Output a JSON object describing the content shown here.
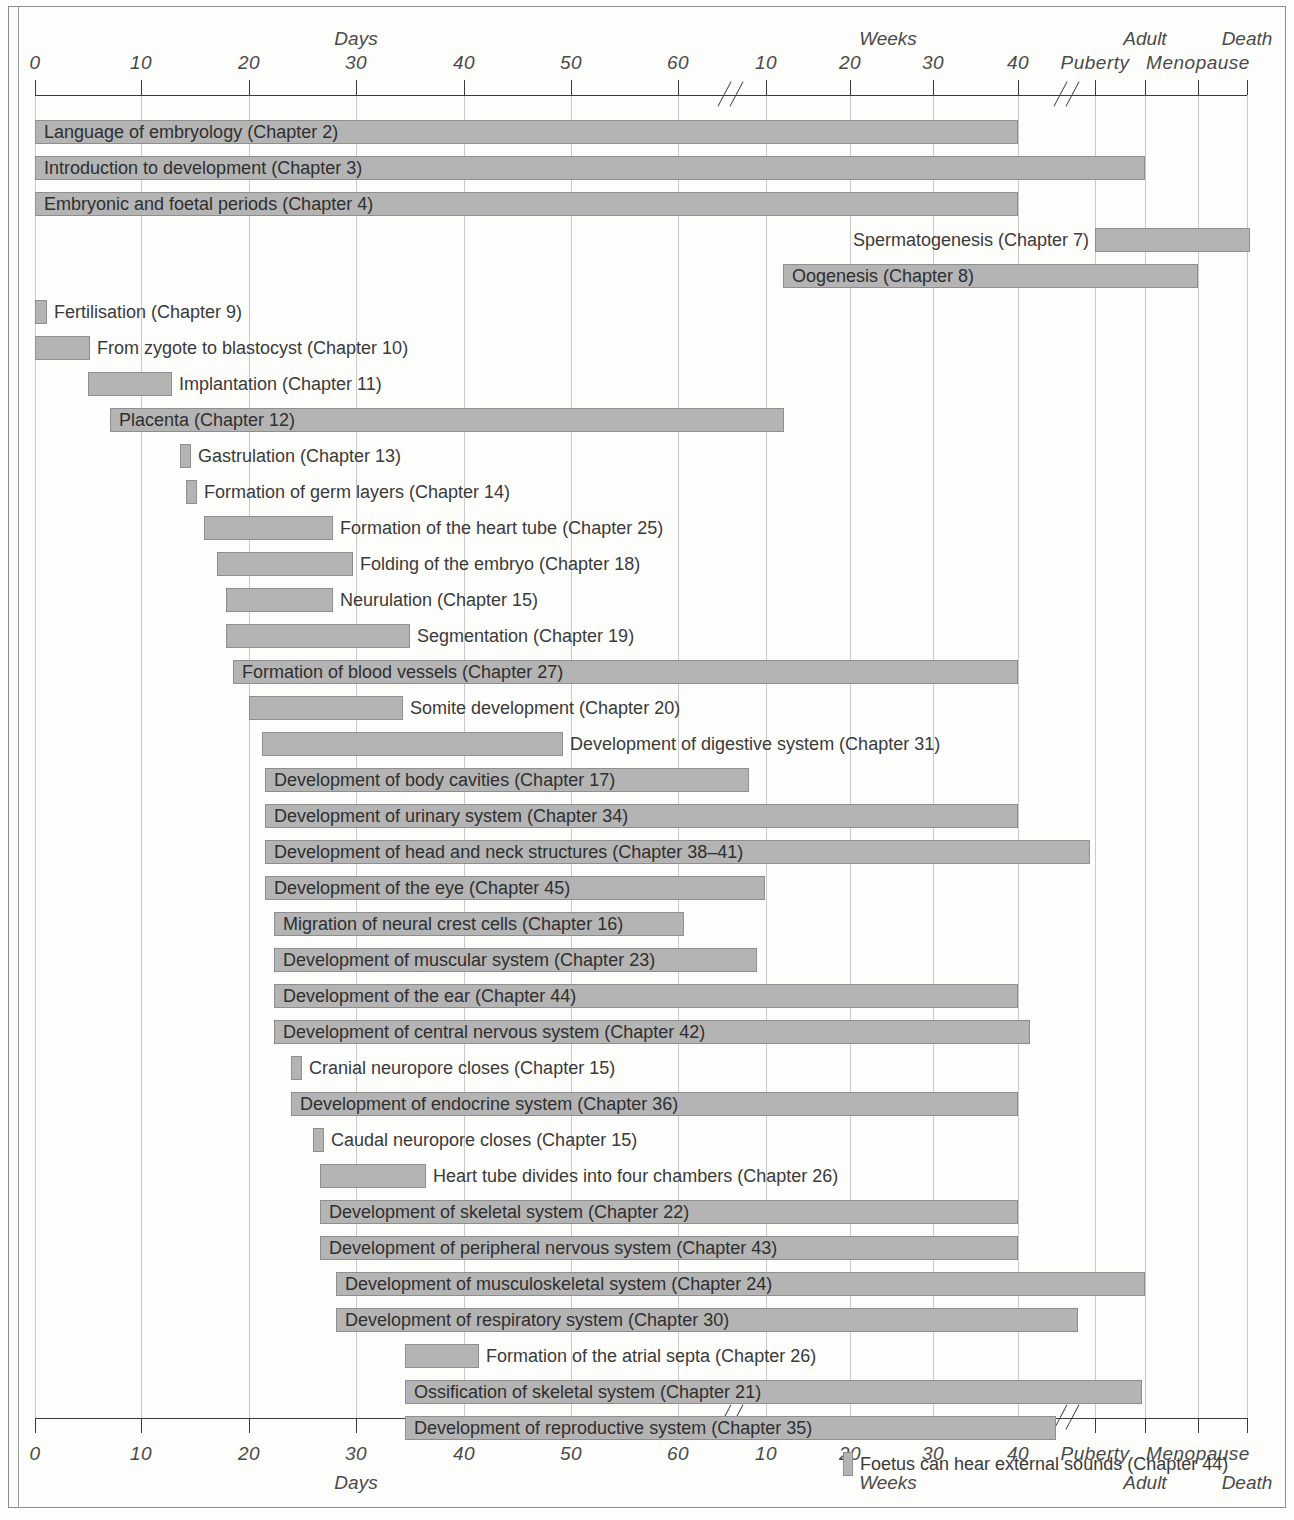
{
  "chart_data": {
    "type": "bar",
    "title": "",
    "subtitle": "",
    "orientation": "horizontal",
    "xlabel": "",
    "ylabel": "",
    "grid": true,
    "legend": null,
    "axis": {
      "top_unit_labels": [
        "Days",
        "Weeks",
        "Adult",
        "Death"
      ],
      "bottom_unit_labels": [
        "Days",
        "Weeks",
        "Adult",
        "Death"
      ],
      "ticks": [
        {
          "label": "0",
          "unit": "days",
          "value": 0,
          "x": 35
        },
        {
          "label": "10",
          "unit": "days",
          "value": 10,
          "x": 141
        },
        {
          "label": "20",
          "unit": "days",
          "value": 20,
          "x": 249
        },
        {
          "label": "30",
          "unit": "days",
          "value": 30,
          "x": 356
        },
        {
          "label": "40",
          "unit": "days",
          "value": 40,
          "x": 464
        },
        {
          "label": "50",
          "unit": "days",
          "value": 50,
          "x": 571
        },
        {
          "label": "60",
          "unit": "days",
          "value": 60,
          "x": 678
        },
        {
          "label": "10",
          "unit": "weeks",
          "value": 10,
          "x": 766
        },
        {
          "label": "20",
          "unit": "weeks",
          "value": 20,
          "x": 850
        },
        {
          "label": "30",
          "unit": "weeks",
          "value": 30,
          "x": 933
        },
        {
          "label": "40",
          "unit": "weeks",
          "value": 40,
          "x": 1018
        },
        {
          "label": "Puberty",
          "unit": "stage",
          "value": null,
          "x": 1095
        },
        {
          "label": "Menopause",
          "unit": "stage",
          "value": null,
          "x": 1198
        },
        {
          "label": "",
          "unit": "stage",
          "value": null,
          "x": 1145
        },
        {
          "label": "",
          "unit": "stage",
          "value": null,
          "x": 1247
        }
      ],
      "breaks": [
        {
          "label": "axis-break-days-to-weeks",
          "x": 716
        },
        {
          "label": "axis-break-weeks-to-adult",
          "x": 1052
        }
      ],
      "stage_labels_top": [
        {
          "label": "Adult",
          "x": 1145
        },
        {
          "label": "Death",
          "x": 1247
        }
      ],
      "stage_labels_bottom": [
        {
          "label": "Adult",
          "x": 1145
        },
        {
          "label": "Death",
          "x": 1247
        }
      ]
    },
    "categories": [
      "Language of embryology (Chapter 2)",
      "Introduction to development (Chapter 3)",
      "Embryonic and foetal periods (Chapter 4)",
      "Spermatogenesis (Chapter 7)",
      "Oogenesis (Chapter 8)",
      "Fertilisation (Chapter 9)",
      "From zygote to blastocyst (Chapter 10)",
      "Implantation (Chapter 11)",
      "Placenta (Chapter 12)",
      "Gastrulation (Chapter 13)",
      "Formation of germ layers (Chapter 14)",
      "Formation of the heart tube (Chapter 25)",
      "Folding of the embryo (Chapter 18)",
      "Neurulation (Chapter 15)",
      "Segmentation (Chapter 19)",
      "Formation of blood vessels (Chapter 27)",
      "Somite development (Chapter 20)",
      "Development of digestive system (Chapter 31)",
      "Development of body cavities (Chapter 17)",
      "Development of urinary system (Chapter 34)",
      "Development of head and neck structures (Chapter 38–41)",
      "Development of the eye (Chapter 45)",
      "Migration of neural crest cells (Chapter 16)",
      "Development of muscular system (Chapter 23)",
      "Development of the ear (Chapter 44)",
      "Development of central nervous system (Chapter 42)",
      "Cranial neuropore closes (Chapter 15)",
      "Development of endocrine system (Chapter 36)",
      "Caudal neuropore closes (Chapter 15)",
      "Heart tube divides into four chambers (Chapter 26)",
      "Development of skeletal system (Chapter 22)",
      "Development of peripheral nervous system (Chapter 43)",
      "Development of musculoskeletal system (Chapter 24)",
      "Development of respiratory system (Chapter 30)",
      "Formation of the atrial septa (Chapter 26)",
      "Ossification of skeletal system (Chapter 21)",
      "Development of reproductive system (Chapter 35)",
      "Foetus can hear external sounds (Chapter 44)"
    ],
    "bars": [
      {
        "label": "Language of embryology (Chapter 2)",
        "start": 35,
        "end": 1018,
        "y": 120,
        "label_pos": "inside"
      },
      {
        "label": "Introduction to development (Chapter 3)",
        "start": 35,
        "end": 1145,
        "y": 156,
        "label_pos": "inside"
      },
      {
        "label": "Embryonic and foetal periods (Chapter 4)",
        "start": 35,
        "end": 1018,
        "y": 192,
        "label_pos": "inside"
      },
      {
        "label": "Spermatogenesis (Chapter 7)",
        "start": 1095,
        "end": 1250,
        "y": 228,
        "label_pos": "left"
      },
      {
        "label": "Oogenesis (Chapter 8)",
        "start": 783,
        "end": 1198,
        "y": 264,
        "label_pos": "inside"
      },
      {
        "label": "Fertilisation (Chapter 9)",
        "start": 35,
        "end": 47,
        "y": 300,
        "label_pos": "right"
      },
      {
        "label": "From zygote to blastocyst (Chapter 10)",
        "start": 35,
        "end": 90,
        "y": 336,
        "label_pos": "right"
      },
      {
        "label": "Implantation (Chapter 11)",
        "start": 88,
        "end": 172,
        "y": 372,
        "label_pos": "right"
      },
      {
        "label": "Placenta (Chapter 12)",
        "start": 110,
        "end": 784,
        "y": 408,
        "label_pos": "inside"
      },
      {
        "label": "Gastrulation (Chapter 13)",
        "start": 180,
        "end": 191,
        "y": 444,
        "label_pos": "right"
      },
      {
        "label": "Formation of germ layers (Chapter 14)",
        "start": 186,
        "end": 197,
        "y": 480,
        "label_pos": "right"
      },
      {
        "label": "Formation of the heart tube (Chapter 25)",
        "start": 204,
        "end": 333,
        "y": 516,
        "label_pos": "right"
      },
      {
        "label": "Folding of the embryo (Chapter 18)",
        "start": 217,
        "end": 353,
        "y": 552,
        "label_pos": "right"
      },
      {
        "label": "Neurulation (Chapter 15)",
        "start": 226,
        "end": 333,
        "y": 588,
        "label_pos": "right"
      },
      {
        "label": "Segmentation (Chapter 19)",
        "start": 226,
        "end": 410,
        "y": 624,
        "label_pos": "right"
      },
      {
        "label": "Formation of blood vessels (Chapter 27)",
        "start": 233,
        "end": 1018,
        "y": 660,
        "label_pos": "inside"
      },
      {
        "label": "Somite development (Chapter 20)",
        "start": 249,
        "end": 403,
        "y": 696,
        "label_pos": "right"
      },
      {
        "label": "Development of digestive system (Chapter 31)",
        "start": 262,
        "end": 563,
        "y": 732,
        "label_pos": "right"
      },
      {
        "label": "Development of body cavities (Chapter 17)",
        "start": 265,
        "end": 749,
        "y": 768,
        "label_pos": "inside"
      },
      {
        "label": "Development of urinary system (Chapter 34)",
        "start": 265,
        "end": 1018,
        "y": 804,
        "label_pos": "inside"
      },
      {
        "label": "Development of head and neck structures (Chapter 38–41)",
        "start": 265,
        "end": 1090,
        "y": 840,
        "label_pos": "inside"
      },
      {
        "label": "Development of the eye (Chapter 45)",
        "start": 265,
        "end": 765,
        "y": 876,
        "label_pos": "inside"
      },
      {
        "label": "Migration of neural crest cells (Chapter 16)",
        "start": 274,
        "end": 684,
        "y": 912,
        "label_pos": "inside"
      },
      {
        "label": "Development of muscular system (Chapter 23)",
        "start": 274,
        "end": 757,
        "y": 948,
        "label_pos": "inside"
      },
      {
        "label": "Development of the ear (Chapter 44)",
        "start": 274,
        "end": 1018,
        "y": 984,
        "label_pos": "inside"
      },
      {
        "label": "Development of central nervous system (Chapter 42)",
        "start": 274,
        "end": 1030,
        "y": 1020,
        "label_pos": "inside"
      },
      {
        "label": "Cranial neuropore closes (Chapter 15)",
        "start": 291,
        "end": 302,
        "y": 1056,
        "label_pos": "right"
      },
      {
        "label": "Development of endocrine system (Chapter 36)",
        "start": 291,
        "end": 1018,
        "y": 1092,
        "label_pos": "inside"
      },
      {
        "label": "Caudal neuropore closes (Chapter 15)",
        "start": 313,
        "end": 324,
        "y": 1128,
        "label_pos": "right"
      },
      {
        "label": "Heart tube divides into four chambers (Chapter 26)",
        "start": 320,
        "end": 426,
        "y": 1164,
        "label_pos": "right"
      },
      {
        "label": "Development of skeletal system (Chapter 22)",
        "start": 320,
        "end": 1018,
        "y": 1200,
        "label_pos": "inside"
      },
      {
        "label": "Development of peripheral nervous system (Chapter 43)",
        "start": 320,
        "end": 1018,
        "y": 1236,
        "label_pos": "inside"
      },
      {
        "label": "Development of musculoskeletal system (Chapter 24)",
        "start": 336,
        "end": 1145,
        "y": 1272,
        "label_pos": "inside"
      },
      {
        "label": "Development of respiratory system (Chapter 30)",
        "start": 336,
        "end": 1078,
        "y": 1308,
        "label_pos": "inside"
      },
      {
        "label": "Formation of the atrial septa (Chapter 26)",
        "start": 405,
        "end": 479,
        "y": 1344,
        "label_pos": "right"
      },
      {
        "label": "Ossification of skeletal system (Chapter 21)",
        "start": 405,
        "end": 1142,
        "y": 1380,
        "label_pos": "inside"
      },
      {
        "label": "Development of reproductive system (Chapter 35)",
        "start": 405,
        "end": 1056,
        "y": 1416,
        "label_pos": "inside"
      },
      {
        "label": "Foetus can hear external sounds (Chapter 44)",
        "start": 843,
        "end": 853,
        "y": 1452,
        "label_pos": "right"
      }
    ]
  }
}
